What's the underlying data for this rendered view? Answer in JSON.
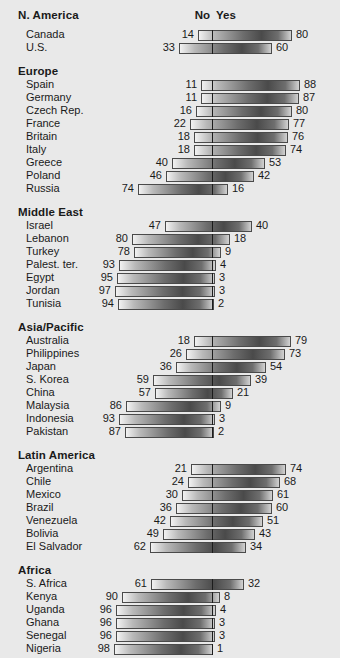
{
  "header": {
    "region_label": "N. America",
    "no_label": "No",
    "yes_label": "Yes"
  },
  "chart_data": {
    "type": "bar",
    "title": "",
    "subtitle": "",
    "xlabel": "",
    "ylabel": "",
    "orientation": "horizontal",
    "layout": "diverging",
    "axis_center_label_left": "No",
    "axis_center_label_right": "Yes",
    "xlim": [
      0,
      100
    ],
    "units": "percent",
    "grid": false,
    "legend": [
      "No",
      "Yes"
    ],
    "legend_position": "top-center",
    "series": [
      {
        "name": "No",
        "values": [
          14,
          33,
          11,
          11,
          16,
          22,
          18,
          18,
          40,
          46,
          74,
          47,
          80,
          78,
          93,
          95,
          97,
          94,
          18,
          26,
          36,
          59,
          57,
          86,
          93,
          87,
          21,
          24,
          30,
          36,
          42,
          49,
          62,
          61,
          90,
          96,
          96,
          96,
          98
        ]
      },
      {
        "name": "Yes",
        "values": [
          80,
          60,
          88,
          87,
          80,
          77,
          76,
          74,
          53,
          42,
          16,
          40,
          18,
          9,
          4,
          3,
          3,
          2,
          79,
          73,
          54,
          39,
          21,
          9,
          3,
          2,
          74,
          68,
          61,
          60,
          51,
          43,
          34,
          32,
          8,
          4,
          3,
          3,
          1
        ]
      }
    ],
    "categories": [
      "Canada",
      "U.S.",
      "Spain",
      "Germany",
      "Czech Rep.",
      "France",
      "Britain",
      "Italy",
      "Greece",
      "Poland",
      "Russia",
      "Israel",
      "Lebanon",
      "Turkey",
      "Palest. ter.",
      "Egypt",
      "Jordan",
      "Tunisia",
      "Australia",
      "Philippines",
      "Japan",
      "S. Korea",
      "China",
      "Malaysia",
      "Indonesia",
      "Pakistan",
      "Argentina",
      "Chile",
      "Mexico",
      "Brazil",
      "Venezuela",
      "Bolivia",
      "El Salvador",
      "S. Africa",
      "Kenya",
      "Uganda",
      "Ghana",
      "Senegal",
      "Nigeria"
    ],
    "groups": [
      {
        "name": "N. America",
        "rows": [
          {
            "label": "Canada",
            "no": 14,
            "yes": 80
          },
          {
            "label": "U.S.",
            "no": 33,
            "yes": 60
          }
        ]
      },
      {
        "name": "Europe",
        "rows": [
          {
            "label": "Spain",
            "no": 11,
            "yes": 88
          },
          {
            "label": "Germany",
            "no": 11,
            "yes": 87
          },
          {
            "label": "Czech Rep.",
            "no": 16,
            "yes": 80
          },
          {
            "label": "France",
            "no": 22,
            "yes": 77
          },
          {
            "label": "Britain",
            "no": 18,
            "yes": 76
          },
          {
            "label": "Italy",
            "no": 18,
            "yes": 74
          },
          {
            "label": "Greece",
            "no": 40,
            "yes": 53
          },
          {
            "label": "Poland",
            "no": 46,
            "yes": 42
          },
          {
            "label": "Russia",
            "no": 74,
            "yes": 16
          }
        ]
      },
      {
        "name": "Middle East",
        "rows": [
          {
            "label": "Israel",
            "no": 47,
            "yes": 40
          },
          {
            "label": "Lebanon",
            "no": 80,
            "yes": 18
          },
          {
            "label": "Turkey",
            "no": 78,
            "yes": 9
          },
          {
            "label": "Palest. ter.",
            "no": 93,
            "yes": 4
          },
          {
            "label": "Egypt",
            "no": 95,
            "yes": 3
          },
          {
            "label": "Jordan",
            "no": 97,
            "yes": 3
          },
          {
            "label": "Tunisia",
            "no": 94,
            "yes": 2
          }
        ]
      },
      {
        "name": "Asia/Pacific",
        "rows": [
          {
            "label": "Australia",
            "no": 18,
            "yes": 79
          },
          {
            "label": "Philippines",
            "no": 26,
            "yes": 73
          },
          {
            "label": "Japan",
            "no": 36,
            "yes": 54
          },
          {
            "label": "S. Korea",
            "no": 59,
            "yes": 39
          },
          {
            "label": "China",
            "no": 57,
            "yes": 21
          },
          {
            "label": "Malaysia",
            "no": 86,
            "yes": 9
          },
          {
            "label": "Indonesia",
            "no": 93,
            "yes": 3
          },
          {
            "label": "Pakistan",
            "no": 87,
            "yes": 2
          }
        ]
      },
      {
        "name": "Latin America",
        "rows": [
          {
            "label": "Argentina",
            "no": 21,
            "yes": 74
          },
          {
            "label": "Chile",
            "no": 24,
            "yes": 68
          },
          {
            "label": "Mexico",
            "no": 30,
            "yes": 61
          },
          {
            "label": "Brazil",
            "no": 36,
            "yes": 60
          },
          {
            "label": "Venezuela",
            "no": 42,
            "yes": 51
          },
          {
            "label": "Bolivia",
            "no": 49,
            "yes": 43
          },
          {
            "label": "El Salvador",
            "no": 62,
            "yes": 34
          }
        ]
      },
      {
        "name": "Africa",
        "rows": [
          {
            "label": "S. Africa",
            "no": 61,
            "yes": 32
          },
          {
            "label": "Kenya",
            "no": 90,
            "yes": 8
          },
          {
            "label": "Uganda",
            "no": 96,
            "yes": 4
          },
          {
            "label": "Ghana",
            "no": 96,
            "yes": 3
          },
          {
            "label": "Senegal",
            "no": 96,
            "yes": 3
          },
          {
            "label": "Nigeria",
            "no": 98,
            "yes": 1
          }
        ]
      }
    ]
  },
  "geometry": {
    "center_x": 212,
    "px_per_unit": 1.0,
    "row_height": 13,
    "first_row_y": 30,
    "group_gap": 9,
    "group_heading_height": 15,
    "bar_height": 11
  },
  "colors": {
    "background": "#e9e9e9",
    "text": "#1a1a1a",
    "bar_border": "#4a4a4a",
    "divider": "#1c1c1c"
  }
}
